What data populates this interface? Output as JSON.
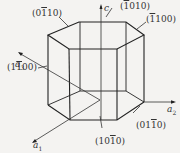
{
  "diagram": {
    "colors": {
      "background": "#f4f3f1",
      "line": "#222222",
      "text": "#333333"
    },
    "axes": [
      {
        "id": "c",
        "label": "c"
      },
      {
        "id": "a1",
        "label": "a",
        "sub": "1"
      },
      {
        "id": "a2",
        "label": "a",
        "sub": "2"
      },
      {
        "id": "a3",
        "label": "a",
        "sub": "3"
      }
    ],
    "planes": [
      {
        "id": "p0110",
        "pre": "(0",
        "bar": "1",
        "post": "10)",
        "text": "(0ī10)"
      },
      {
        "id": "p1010top",
        "pre": "(",
        "bar": "1",
        "post": "010)",
        "text": "(ī010)"
      },
      {
        "id": "p1100right",
        "pre": "(",
        "bar": "1",
        "post": "100)",
        "text": "(ī100)"
      },
      {
        "id": "p1100left",
        "pre": "(1",
        "bar": "1",
        "post": "00)",
        "text": "(1ī00)"
      },
      {
        "id": "p1010bottom",
        "pre": "(10",
        "bar": "1",
        "post": "0)",
        "text": "(10ī0)"
      },
      {
        "id": "p01-10",
        "pre": "(01",
        "bar": "1",
        "post": "0)",
        "text": "(01ī0)"
      }
    ]
  }
}
